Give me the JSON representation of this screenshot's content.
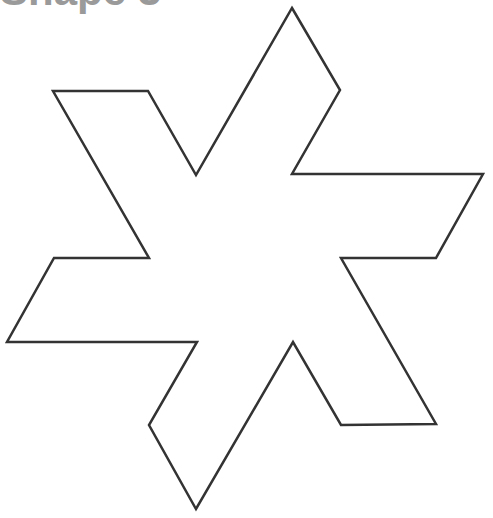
{
  "header": {
    "title": "Shape 3"
  },
  "shape": {
    "name": "six-pointed star outline",
    "stroke_color": "#333333",
    "fill_color": "#ffffff",
    "stroke_width": 2.5,
    "points": "292,8 340,90 292,174 483,174 436,258 341,258 436,424 341,425 293,342 196,509 149,425 197,342 7,342 54,258 149,258 53,91 148,91 196,175"
  }
}
